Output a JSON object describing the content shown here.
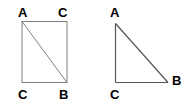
{
  "figures": [
    {
      "name": "square-with-diagonal",
      "shape": "square",
      "stroke_color": "#808080",
      "diagonal": "top-left to bottom-right",
      "labels": {
        "top_left": "A",
        "top_right": "C",
        "bottom_left": "C",
        "bottom_right": "B"
      }
    },
    {
      "name": "right-triangle",
      "shape": "triangle",
      "stroke_color": "#555555",
      "right_angle_at": "bottom-left",
      "labels": {
        "apex": "A",
        "bottom_right": "B",
        "bottom_left": "C"
      }
    }
  ],
  "colors": {
    "background": "#ffffff",
    "label_text": "#000000",
    "square_stroke": "#808080",
    "triangle_stroke": "#555555"
  }
}
